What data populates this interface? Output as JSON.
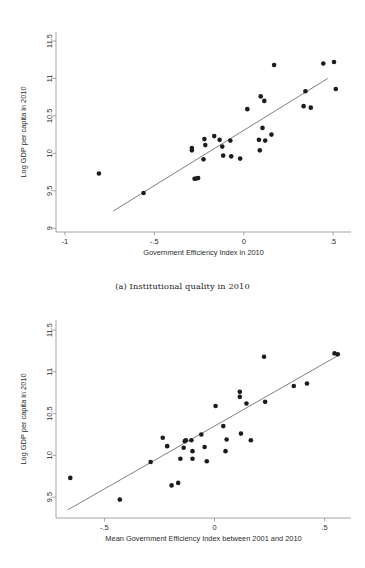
{
  "figure": {
    "caption_a": "(a) Institutional quality in 2010"
  },
  "chart_data": [
    {
      "id": "panel-a",
      "type": "scatter",
      "title": "",
      "caption": "(a) Institutional quality in 2010",
      "xlabel": "Government Efficiency Index in 2010",
      "ylabel": "Log GDP per capita in 2010",
      "xlim": [
        -1.05,
        0.6
      ],
      "ylim": [
        8.95,
        11.62
      ],
      "xticks": [
        -1,
        -0.5,
        0,
        0.5
      ],
      "xticklabels": [
        "-1",
        "-.5",
        "0",
        ".5"
      ],
      "yticks": [
        9,
        9.5,
        10,
        10.5,
        11,
        11.5
      ],
      "yticklabels": [
        "9",
        "9.5",
        "10",
        "10.5",
        "11",
        "11.5"
      ],
      "grid": false,
      "legend": "none",
      "fit_line": {
        "x0": -0.73,
        "y0": 9.23,
        "x1": 0.47,
        "y1": 11.0
      },
      "points": [
        {
          "x": -0.81,
          "y": 9.73
        },
        {
          "x": -0.56,
          "y": 9.47
        },
        {
          "x": -0.29,
          "y": 10.07
        },
        {
          "x": -0.29,
          "y": 10.04
        },
        {
          "x": -0.275,
          "y": 9.66
        },
        {
          "x": -0.265,
          "y": 9.665
        },
        {
          "x": -0.255,
          "y": 9.67
        },
        {
          "x": -0.22,
          "y": 10.19
        },
        {
          "x": -0.215,
          "y": 10.11
        },
        {
          "x": -0.225,
          "y": 9.92
        },
        {
          "x": -0.165,
          "y": 10.23
        },
        {
          "x": -0.135,
          "y": 10.18
        },
        {
          "x": -0.12,
          "y": 10.09
        },
        {
          "x": -0.115,
          "y": 9.97
        },
        {
          "x": -0.075,
          "y": 10.17
        },
        {
          "x": -0.07,
          "y": 9.96
        },
        {
          "x": -0.02,
          "y": 9.93
        },
        {
          "x": 0.02,
          "y": 10.59
        },
        {
          "x": 0.085,
          "y": 10.18
        },
        {
          "x": 0.09,
          "y": 10.04
        },
        {
          "x": 0.095,
          "y": 10.76
        },
        {
          "x": 0.105,
          "y": 10.34
        },
        {
          "x": 0.115,
          "y": 10.7
        },
        {
          "x": 0.12,
          "y": 10.17
        },
        {
          "x": 0.155,
          "y": 10.25
        },
        {
          "x": 0.17,
          "y": 11.18
        },
        {
          "x": 0.335,
          "y": 10.63
        },
        {
          "x": 0.345,
          "y": 10.83
        },
        {
          "x": 0.375,
          "y": 10.61
        },
        {
          "x": 0.445,
          "y": 11.2
        },
        {
          "x": 0.505,
          "y": 11.22
        },
        {
          "x": 0.515,
          "y": 10.86
        }
      ]
    },
    {
      "id": "panel-b",
      "type": "scatter",
      "title": "",
      "caption": "",
      "xlabel": "Mean Government Efficiency Index between 2001 and 2010",
      "ylabel": "Log GDP per capita in 2010",
      "xlim": [
        -0.72,
        0.62
      ],
      "ylim": [
        9.25,
        11.62
      ],
      "xticks": [
        -0.5,
        0,
        0.5
      ],
      "xticklabels": [
        "-.5",
        "0",
        ".5"
      ],
      "yticks": [
        9.5,
        10,
        10.5,
        11,
        11.5
      ],
      "yticklabels": [
        "9.5",
        "10",
        "10.5",
        "11",
        "11.5"
      ],
      "grid": false,
      "legend": "none",
      "fit_line": {
        "x0": -0.665,
        "y0": 9.35,
        "x1": 0.565,
        "y1": 11.2
      },
      "points": [
        {
          "x": -0.655,
          "y": 9.73
        },
        {
          "x": -0.43,
          "y": 9.47
        },
        {
          "x": -0.29,
          "y": 9.92
        },
        {
          "x": -0.235,
          "y": 10.21
        },
        {
          "x": -0.215,
          "y": 10.11
        },
        {
          "x": -0.195,
          "y": 9.64
        },
        {
          "x": -0.165,
          "y": 9.67
        },
        {
          "x": -0.155,
          "y": 9.96
        },
        {
          "x": -0.13,
          "y": 10.18
        },
        {
          "x": -0.135,
          "y": 10.17
        },
        {
          "x": -0.14,
          "y": 10.09
        },
        {
          "x": -0.105,
          "y": 10.18
        },
        {
          "x": -0.1,
          "y": 10.05
        },
        {
          "x": -0.1,
          "y": 9.96
        },
        {
          "x": -0.06,
          "y": 10.25
        },
        {
          "x": -0.045,
          "y": 10.1
        },
        {
          "x": -0.035,
          "y": 9.93
        },
        {
          "x": 0.005,
          "y": 10.59
        },
        {
          "x": 0.04,
          "y": 10.35
        },
        {
          "x": 0.055,
          "y": 10.19
        },
        {
          "x": 0.05,
          "y": 10.05
        },
        {
          "x": 0.115,
          "y": 10.76
        },
        {
          "x": 0.115,
          "y": 10.7
        },
        {
          "x": 0.12,
          "y": 10.26
        },
        {
          "x": 0.145,
          "y": 10.62
        },
        {
          "x": 0.165,
          "y": 10.18
        },
        {
          "x": 0.225,
          "y": 11.18
        },
        {
          "x": 0.23,
          "y": 10.64
        },
        {
          "x": 0.36,
          "y": 10.83
        },
        {
          "x": 0.42,
          "y": 10.86
        },
        {
          "x": 0.545,
          "y": 11.22
        },
        {
          "x": 0.56,
          "y": 11.21
        }
      ]
    }
  ]
}
